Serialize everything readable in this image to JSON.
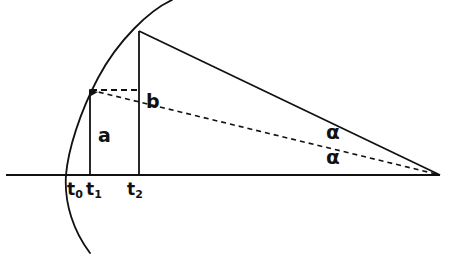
{
  "figure": {
    "background_color": "#ffffff",
    "stroke_color": "#111111"
  },
  "labels": {
    "t0": {
      "text": "t",
      "sub": "0",
      "x": 67,
      "y": 181
    },
    "t1": {
      "text": "t",
      "sub": "1",
      "x": 86,
      "y": 181
    },
    "t2": {
      "text": "t",
      "sub": "2",
      "x": 127,
      "y": 181
    },
    "a": {
      "text": "a",
      "x": 98,
      "y": 126
    },
    "b": {
      "text": "b",
      "x": 146,
      "y": 92
    },
    "alpha_upper": {
      "text": "α",
      "x": 326,
      "y": 122
    },
    "alpha_lower": {
      "text": "α",
      "x": 326,
      "y": 147
    }
  },
  "geometry": {
    "baseline": {
      "x1": 6,
      "y1": 175,
      "x2": 440,
      "y2": 175,
      "width": 1.8
    },
    "apex": {
      "x": 440,
      "y": 175
    },
    "vertical_t1": {
      "x": 90,
      "y_top": 90,
      "y_bottom": 175,
      "width": 1.8
    },
    "vertical_t2": {
      "x": 139,
      "y_top": 31,
      "y_bottom": 175,
      "width": 1.8
    },
    "hypotenuse_solid": {
      "x1": 139,
      "y1": 31,
      "x2": 440,
      "y2": 175,
      "width": 1.8
    },
    "hypotenuse_dashed": {
      "x1": 90,
      "y1": 90,
      "x2": 440,
      "y2": 175,
      "width": 1.6,
      "dash": "5,4"
    },
    "horizontal_dashed": {
      "x1": 91,
      "y1": 90,
      "x2": 139,
      "y2": 90,
      "width": 2.0,
      "dash": "6,4"
    },
    "arc_path": "M 172 0 C 150 10, 118 40, 98 78 C 80 112, 68 150, 66 175 C 64 204, 74 232, 90 253",
    "arc_width": 1.8,
    "arc_endpoints": {
      "top": {
        "x": 172,
        "y": 0
      },
      "bottom": {
        "x": 90,
        "y": 253
      }
    },
    "tick_t0_x": 66,
    "arrow_head_t1": {
      "x": 90,
      "y": 90
    }
  }
}
